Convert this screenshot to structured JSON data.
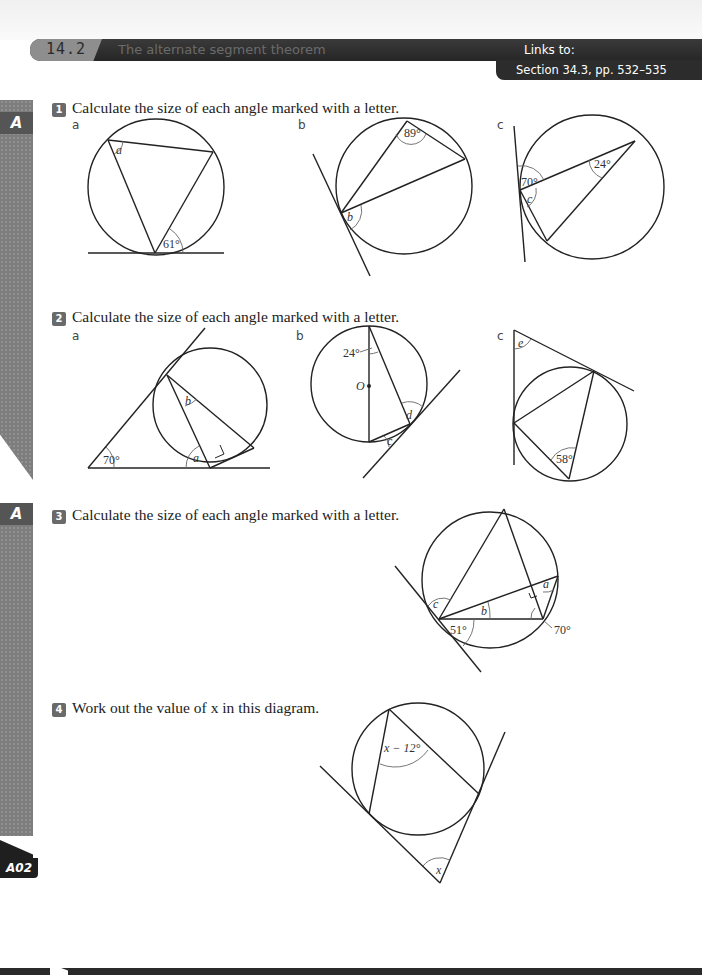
{
  "header": {
    "section_number": "14.2",
    "section_title": "The alternate segment theorem",
    "links_label": "Links to:",
    "links_reference": "Section 34.3, pp. 532–535"
  },
  "sidebar": {
    "grade_badges": [
      "A",
      "A"
    ],
    "assessment_badge": "A02"
  },
  "questions": [
    {
      "number": "1",
      "text": "Calculate the size of each angle marked with a letter.",
      "parts": [
        {
          "label": "a",
          "given_angles": [
            "61°"
          ],
          "unknowns": [
            "a"
          ]
        },
        {
          "label": "b",
          "given_angles": [
            "89°"
          ],
          "unknowns": [
            "b"
          ]
        },
        {
          "label": "c",
          "given_angles": [
            "70°",
            "24°"
          ],
          "unknowns": [
            "c"
          ]
        }
      ]
    },
    {
      "number": "2",
      "text": "Calculate the size of each angle marked with a letter.",
      "parts": [
        {
          "label": "a",
          "given_angles": [
            "70°"
          ],
          "unknowns": [
            "a",
            "b"
          ]
        },
        {
          "label": "b",
          "given_angles": [
            "24°"
          ],
          "centre_label": "O",
          "unknowns": [
            "c",
            "d"
          ]
        },
        {
          "label": "c",
          "given_angles": [
            "58°"
          ],
          "unknowns": [
            "e"
          ]
        }
      ]
    },
    {
      "number": "3",
      "text": "Calculate the size of each angle marked with a letter.",
      "given_angles": [
        "51°",
        "70°"
      ],
      "unknowns": [
        "a",
        "b",
        "c"
      ]
    },
    {
      "number": "4",
      "text": "Work out the value of x in this diagram.",
      "given_angles": [
        "x − 12°"
      ],
      "unknowns": [
        "x"
      ]
    }
  ]
}
